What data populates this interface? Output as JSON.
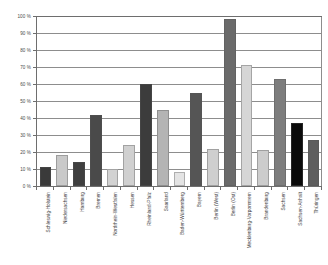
{
  "chart_data": {
    "type": "bar",
    "title": "",
    "subtitle": "",
    "xlabel": "",
    "ylabel": "",
    "ylim": [
      0,
      100
    ],
    "y_tick_labels": [
      "0 %",
      "10 %",
      "20 %",
      "30 %",
      "40 %",
      "50 %",
      "60 %",
      "70 %",
      "80 %",
      "90 %",
      "100 %"
    ],
    "y_tick_values": [
      0,
      10,
      20,
      30,
      40,
      50,
      60,
      70,
      80,
      90,
      100
    ],
    "grid": true,
    "legend": "none",
    "categories": [
      "Schleswig-Holstein",
      "Niedersachsen",
      "Hamburg",
      "Bremen",
      "Nordrhein-Westfalen",
      "Hessen",
      "Rheinland-Pfalz",
      "Saarland",
      "Baden-Württemberg",
      "Bayern",
      "Berlin (West)",
      "Berlin (Ost)",
      "Mecklenburg-Vorpommern",
      "Brandenburg",
      "Sachsen",
      "Sachsen-Anhalt",
      "Thüringen"
    ],
    "values": [
      11,
      18,
      14,
      42,
      10,
      24,
      60,
      45,
      8,
      55,
      22,
      98,
      71,
      21,
      63,
      37,
      27
    ],
    "bar_colors": [
      "#3a3a3a",
      "#c9c9c9",
      "#3f3f3f",
      "#4a4a4a",
      "#d2d2d2",
      "#d0d0d0",
      "#3c3c3c",
      "#b4b4b4",
      "#e4e4e4",
      "#555555",
      "#cfcfcf",
      "#6a6a6a",
      "#d6d6d6",
      "#cccccc",
      "#7d7d7d",
      "#0a0a0a",
      "#5e5e5e"
    ]
  },
  "style": {
    "axis_color": "#6e6e6e",
    "grid_color": "#8d8d8d",
    "background": "#ffffff",
    "text_color": "#3d3d3d"
  }
}
